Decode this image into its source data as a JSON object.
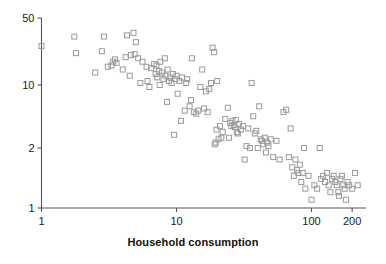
{
  "chart_data": {
    "type": "scatter",
    "title": "",
    "xlabel": "Household consumption",
    "ylabel": "",
    "xscale": "log",
    "yscale": "log",
    "xlim": [
      1,
      230
    ],
    "ylim": [
      1,
      50
    ],
    "xticks": [
      1,
      10,
      100,
      200
    ],
    "xticklabels": [
      "1",
      "10",
      "100",
      "200"
    ],
    "yticks": [
      1,
      2,
      10,
      50
    ],
    "yticklabels": [
      "1",
      "2",
      "10",
      "50"
    ],
    "grid": false,
    "legend": null,
    "marker": "open-square",
    "marker_color": "#9a9a9a",
    "marker_size": 5,
    "n_points": 148,
    "points": [
      [
        1.0,
        25.5
      ],
      [
        1.75,
        32.0
      ],
      [
        1.8,
        21.5
      ],
      [
        2.5,
        13.5
      ],
      [
        2.8,
        22.5
      ],
      [
        2.9,
        32.0
      ],
      [
        3.1,
        15.5
      ],
      [
        3.3,
        16.0
      ],
      [
        3.4,
        17.5
      ],
      [
        3.5,
        18.5
      ],
      [
        3.6,
        17.0
      ],
      [
        4.0,
        14.5
      ],
      [
        4.2,
        19.5
      ],
      [
        4.3,
        33.0
      ],
      [
        4.5,
        12.5
      ],
      [
        4.6,
        20.5
      ],
      [
        4.8,
        35.0
      ],
      [
        4.9,
        21.0
      ],
      [
        5.0,
        28.0
      ],
      [
        5.2,
        19.0
      ],
      [
        5.4,
        10.5
      ],
      [
        5.6,
        17.5
      ],
      [
        6.0,
        15.5
      ],
      [
        6.1,
        11.0
      ],
      [
        6.3,
        9.5
      ],
      [
        6.5,
        15.0
      ],
      [
        6.8,
        16.5
      ],
      [
        7.0,
        13.0
      ],
      [
        7.1,
        16.0
      ],
      [
        7.2,
        12.0
      ],
      [
        7.4,
        14.0
      ],
      [
        7.5,
        10.0
      ],
      [
        7.6,
        17.5
      ],
      [
        7.8,
        13.5
      ],
      [
        8.0,
        11.5
      ],
      [
        8.2,
        19.0
      ],
      [
        8.3,
        12.5
      ],
      [
        8.5,
        6.5
      ],
      [
        8.6,
        14.5
      ],
      [
        8.8,
        11.0
      ],
      [
        9.0,
        12.0
      ],
      [
        9.2,
        10.5
      ],
      [
        9.4,
        13.0
      ],
      [
        9.6,
        2.8
      ],
      [
        9.8,
        11.5
      ],
      [
        10.0,
        12.5
      ],
      [
        10.2,
        8.0
      ],
      [
        10.5,
        11.0
      ],
      [
        10.8,
        4.0
      ],
      [
        11.0,
        12.0
      ],
      [
        11.5,
        5.2
      ],
      [
        11.8,
        10.5
      ],
      [
        12.0,
        11.5
      ],
      [
        12.5,
        5.8
      ],
      [
        12.8,
        6.8
      ],
      [
        13.0,
        19.0
      ],
      [
        13.5,
        5.0
      ],
      [
        14.0,
        4.8
      ],
      [
        14.5,
        5.2
      ],
      [
        15.0,
        9.5
      ],
      [
        15.5,
        14.5
      ],
      [
        16.0,
        5.5
      ],
      [
        16.5,
        8.5
      ],
      [
        17.0,
        5.0
      ],
      [
        17.5,
        9.0
      ],
      [
        18.0,
        10.5
      ],
      [
        18.5,
        24.5
      ],
      [
        19.0,
        22.0
      ],
      [
        19.2,
        2.2
      ],
      [
        19.5,
        2.3
      ],
      [
        19.8,
        3.2
      ],
      [
        20.0,
        11.0
      ],
      [
        20.5,
        2.5
      ],
      [
        21.0,
        3.5
      ],
      [
        21.5,
        2.6
      ],
      [
        22.0,
        3.0
      ],
      [
        23.0,
        4.2
      ],
      [
        24.0,
        5.6
      ],
      [
        24.5,
        2.6
      ],
      [
        25.0,
        3.8
      ],
      [
        25.5,
        3.5
      ],
      [
        26.0,
        4.0
      ],
      [
        26.5,
        3.6
      ],
      [
        27.0,
        3.4
      ],
      [
        27.5,
        4.1
      ],
      [
        28.0,
        3.0
      ],
      [
        28.5,
        2.9
      ],
      [
        29.0,
        3.7
      ],
      [
        30.0,
        3.2
      ],
      [
        31.0,
        3.5
      ],
      [
        32.0,
        1.75
      ],
      [
        33.0,
        2.1
      ],
      [
        34.0,
        3.3
      ],
      [
        35.0,
        2.0
      ],
      [
        36.0,
        10.5
      ],
      [
        37.0,
        4.5
      ],
      [
        38.0,
        2.9
      ],
      [
        39.0,
        3.1
      ],
      [
        40.0,
        2.0
      ],
      [
        41.0,
        5.8
      ],
      [
        42.0,
        2.5
      ],
      [
        43.0,
        2.4
      ],
      [
        44.0,
        2.2
      ],
      [
        45.0,
        2.6
      ],
      [
        46.0,
        1.9
      ],
      [
        47.0,
        2.3
      ],
      [
        48.0,
        2.1
      ],
      [
        50.0,
        2.5
      ],
      [
        52.0,
        1.8
      ],
      [
        55.0,
        2.4
      ],
      [
        58.0,
        1.75
      ],
      [
        62.0,
        5.0
      ],
      [
        65.0,
        5.3
      ],
      [
        68.0,
        1.8
      ],
      [
        70.0,
        3.3
      ],
      [
        72.0,
        1.6
      ],
      [
        74.0,
        1.45
      ],
      [
        76.0,
        1.75
      ],
      [
        78.0,
        1.55
      ],
      [
        80.0,
        1.5
      ],
      [
        82.0,
        1.65
      ],
      [
        84.0,
        1.35
      ],
      [
        86.0,
        1.5
      ],
      [
        88.0,
        2.0
      ],
      [
        90.0,
        1.25
      ],
      [
        95.0,
        1.45
      ],
      [
        100.0,
        1.1
      ],
      [
        105.0,
        1.3
      ],
      [
        110.0,
        1.25
      ],
      [
        115.0,
        2.0
      ],
      [
        118.0,
        1.4
      ],
      [
        122.0,
        1.45
      ],
      [
        126.0,
        1.35
      ],
      [
        130.0,
        1.5
      ],
      [
        134.0,
        1.3
      ],
      [
        138.0,
        1.2
      ],
      [
        142.0,
        1.4
      ],
      [
        146.0,
        1.45
      ],
      [
        150.0,
        1.35
      ],
      [
        154.0,
        1.3
      ],
      [
        158.0,
        1.2
      ],
      [
        160.0,
        1.15
      ],
      [
        164.0,
        1.4
      ],
      [
        168.0,
        1.45
      ],
      [
        172.0,
        1.3
      ],
      [
        176.0,
        1.25
      ],
      [
        180.0,
        1.1
      ],
      [
        185.0,
        1.35
      ],
      [
        190.0,
        1.3
      ],
      [
        200.0,
        1.25
      ],
      [
        210.0,
        1.5
      ],
      [
        220.0,
        1.3
      ]
    ]
  },
  "axes": {
    "x_title": "Household consumption",
    "y_title": ""
  },
  "style": {
    "background": "#ffffff",
    "axis_color": "#555555",
    "text_color": "#1a1a1a",
    "marker_stroke": "#9a9a9a"
  }
}
